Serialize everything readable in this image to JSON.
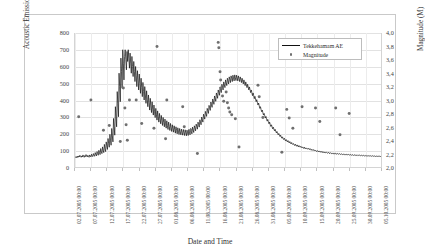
{
  "chart_data": {
    "type": "line",
    "title": "",
    "xlabel": "Date and Time",
    "ylabel": "Acoustic Emission Count",
    "y2label": "Magnitude (M)",
    "ylim": [
      0,
      800
    ],
    "y2lim": [
      2.0,
      4.0
    ],
    "grid": true,
    "legend_position": "top-right",
    "y_ticks": [
      "0",
      "100",
      "200",
      "300",
      "400",
      "500",
      "600",
      "700",
      "800"
    ],
    "y2_ticks": [
      "2,0",
      "2,2",
      "2,4",
      "2,6",
      "2,8",
      "3,0",
      "3,2",
      "3,4",
      "3,6",
      "3,8",
      "4,0"
    ],
    "x_ticks": [
      "02.07.2005 00:00",
      "07.07.2005 00:00",
      "12.07.2005 00:00",
      "17.07.2005 00:00",
      "22.07.2005 00:00",
      "27.07.2005 00:00",
      "01.08.2005 00:00",
      "06.08.2005 00:00",
      "11.08.2005 00:00",
      "16.08.2005 00:00",
      "21.08.2005 00:00",
      "26.08.2005 00:00",
      "31.08.2005 00:00",
      "05.09.2005 00:00",
      "10.09.2005 00:00",
      "15.09.2005 00:00",
      "20.09.2005 00:00",
      "25.09.2005 00:00",
      "30.09.2005 00:00",
      "05.10.2005 00:00"
    ],
    "series": [
      {
        "name": "Tekkehamam AE",
        "type": "line",
        "color": "#111111",
        "axis": "left",
        "values": [
          60,
          58,
          62,
          55,
          64,
          58,
          66,
          60,
          70,
          62,
          58,
          66,
          60,
          72,
          64,
          58,
          68,
          62,
          74,
          66,
          60,
          70,
          64,
          58,
          72,
          66,
          60,
          76,
          68,
          62,
          80,
          70,
          64,
          86,
          74,
          66,
          92,
          80,
          70,
          100,
          86,
          74,
          110,
          92,
          80,
          120,
          100,
          86,
          135,
          110,
          92,
          150,
          126,
          105,
          170,
          140,
          118,
          195,
          160,
          130,
          230,
          186,
          150,
          290,
          240,
          190,
          360,
          300,
          240,
          450,
          380,
          300,
          560,
          480,
          390,
          650,
          570,
          470,
          700,
          620,
          520,
          660,
          700,
          640,
          580,
          690,
          630,
          700,
          650,
          590,
          680,
          620,
          560,
          660,
          600,
          540,
          630,
          570,
          510,
          600,
          545,
          480,
          575,
          520,
          460,
          555,
          500,
          440,
          530,
          475,
          420,
          505,
          450,
          400,
          480,
          430,
          380,
          455,
          405,
          360,
          430,
          385,
          340,
          410,
          365,
          325,
          390,
          345,
          310,
          370,
          330,
          295,
          350,
          315,
          280,
          335,
          300,
          268,
          320,
          288,
          258,
          308,
          276,
          248,
          296,
          266,
          240,
          286,
          258,
          232,
          276,
          248,
          224,
          268,
          242,
          218,
          260,
          236,
          212,
          252,
          230,
          208,
          246,
          224,
          202,
          240,
          218,
          198,
          234,
          214,
          194,
          230,
          210,
          192,
          226,
          208,
          190,
          224,
          206,
          188,
          222,
          204,
          186,
          220,
          204,
          188,
          224,
          208,
          192,
          230,
          214,
          198,
          238,
          222,
          206,
          246,
          232,
          216,
          256,
          242,
          226,
          268,
          254,
          238,
          282,
          268,
          252,
          298,
          284,
          268,
          315,
          302,
          286,
          332,
          318,
          302,
          350,
          336,
          320,
          368,
          354,
          338,
          388,
          372,
          356,
          406,
          392,
          374,
          424,
          410,
          392,
          442,
          428,
          410,
          460,
          446,
          428,
          478,
          462,
          444,
          494,
          478,
          460,
          508,
          492,
          474,
          520,
          504,
          486,
          530,
          514,
          496,
          538,
          522,
          504,
          544,
          528,
          510,
          548,
          532,
          514,
          550,
          534,
          516,
          548,
          532,
          514,
          544,
          528,
          510,
          538,
          522,
          504,
          530,
          514,
          496,
          520,
          504,
          486,
          508,
          492,
          474,
          494,
          478,
          460,
          478,
          462,
          444,
          460,
          444,
          426,
          442,
          426,
          408,
          422,
          406,
          390,
          402,
          386,
          370,
          382,
          366,
          350,
          360,
          344,
          330,
          340,
          324,
          310,
          320,
          306,
          292,
          302,
          288,
          274,
          284,
          270,
          258,
          268,
          254,
          242,
          252,
          240,
          228,
          238,
          226,
          216,
          225,
          214,
          204,
          212,
          202,
          192,
          200,
          190,
          182,
          190,
          180,
          172,
          180,
          170,
          164,
          172,
          163,
          156,
          164,
          156,
          150,
          158,
          150,
          144,
          152,
          144,
          138,
          146,
          138,
          134,
          140,
          134,
          128,
          136,
          130,
          124,
          132,
          126,
          120,
          128,
          122,
          118,
          124,
          118,
          114,
          120,
          116,
          110,
          118,
          112,
          108,
          114,
          110,
          106,
          112,
          108,
          104,
          110,
          105,
          100,
          106,
          102,
          98,
          104,
          100,
          96,
          100,
          96,
          92,
          98,
          94,
          90,
          96,
          92,
          88,
          94,
          90,
          86,
          92,
          88,
          84,
          90,
          86,
          84,
          88,
          85,
          82,
          87,
          84,
          80,
          86,
          82,
          80,
          84,
          80,
          78,
          83,
          80,
          77,
          82,
          79,
          76,
          81,
          78,
          76,
          80,
          77,
          75,
          79,
          76,
          74,
          78,
          75,
          73,
          77,
          74,
          72,
          76,
          74,
          72,
          75,
          73,
          71,
          74,
          72,
          70,
          74,
          71,
          69,
          73,
          71,
          69,
          72,
          70,
          68,
          72,
          70,
          68,
          71,
          69,
          67,
          70,
          68,
          67,
          70,
          68,
          66,
          69,
          67,
          66,
          68,
          66,
          65,
          68,
          66,
          65,
          67,
          65,
          64,
          67,
          65,
          64,
          66,
          65,
          63,
          66,
          64,
          63,
          65,
          64,
          63,
          65,
          63,
          62
        ]
      },
      {
        "name": "Magnitude",
        "type": "scatter",
        "color": "#6f6f6f",
        "axis": "right",
        "points": [
          {
            "x": 0.012,
            "y": 2.75
          },
          {
            "x": 0.052,
            "y": 3.0
          },
          {
            "x": 0.093,
            "y": 2.55
          },
          {
            "x": 0.112,
            "y": 2.62
          },
          {
            "x": 0.148,
            "y": 2.38
          },
          {
            "x": 0.158,
            "y": 3.18
          },
          {
            "x": 0.163,
            "y": 2.88
          },
          {
            "x": 0.167,
            "y": 2.63
          },
          {
            "x": 0.171,
            "y": 2.4
          },
          {
            "x": 0.178,
            "y": 3.0
          },
          {
            "x": 0.2,
            "y": 3.0
          },
          {
            "x": 0.218,
            "y": 2.65
          },
          {
            "x": 0.258,
            "y": 2.58
          },
          {
            "x": 0.268,
            "y": 3.8
          },
          {
            "x": 0.296,
            "y": 2.42
          },
          {
            "x": 0.3,
            "y": 3.0
          },
          {
            "x": 0.352,
            "y": 2.9
          },
          {
            "x": 0.357,
            "y": 2.6
          },
          {
            "x": 0.378,
            "y": 2.55
          },
          {
            "x": 0.4,
            "y": 2.2
          },
          {
            "x": 0.468,
            "y": 3.86
          },
          {
            "x": 0.47,
            "y": 3.78
          },
          {
            "x": 0.474,
            "y": 3.42
          },
          {
            "x": 0.476,
            "y": 3.3
          },
          {
            "x": 0.478,
            "y": 3.18
          },
          {
            "x": 0.482,
            "y": 3.06
          },
          {
            "x": 0.486,
            "y": 2.98
          },
          {
            "x": 0.494,
            "y": 3.12
          },
          {
            "x": 0.498,
            "y": 2.96
          },
          {
            "x": 0.502,
            "y": 2.88
          },
          {
            "x": 0.506,
            "y": 2.82
          },
          {
            "x": 0.512,
            "y": 2.78
          },
          {
            "x": 0.524,
            "y": 2.72
          },
          {
            "x": 0.536,
            "y": 2.3
          },
          {
            "x": 0.598,
            "y": 3.22
          },
          {
            "x": 0.602,
            "y": 3.05
          },
          {
            "x": 0.614,
            "y": 2.74
          },
          {
            "x": 0.692,
            "y": 2.86
          },
          {
            "x": 0.7,
            "y": 2.73
          },
          {
            "x": 0.712,
            "y": 2.58
          },
          {
            "x": 0.742,
            "y": 2.9
          },
          {
            "x": 0.786,
            "y": 2.88
          },
          {
            "x": 0.8,
            "y": 2.68
          },
          {
            "x": 0.852,
            "y": 2.88
          },
          {
            "x": 0.866,
            "y": 2.48
          },
          {
            "x": 0.896,
            "y": 2.8
          },
          {
            "x": 0.676,
            "y": 2.22
          }
        ]
      }
    ]
  },
  "legend": {
    "items": [
      {
        "label": "Tekkehamam AE",
        "marker": "line"
      },
      {
        "label": "Magnitude",
        "marker": "dot"
      }
    ]
  }
}
